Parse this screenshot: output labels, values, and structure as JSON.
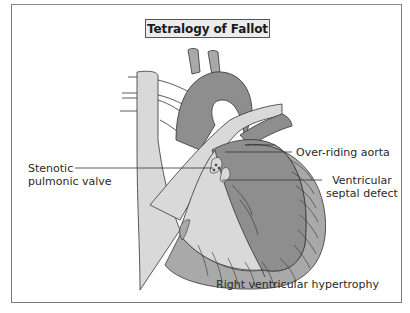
{
  "title": "Tetralogy of Fallot",
  "labels": {
    "stenotic_pulmonic_valve": {
      "line1": "Stenotic",
      "line2": "pulmonic valve"
    },
    "over_riding_aorta": "Over-riding aorta",
    "ventricular_septal_defect": {
      "line1": "Ventricular",
      "line2": "septal defect"
    },
    "right_ventricular_hypertrophy": "Right ventricular hypertrophy"
  },
  "colors": {
    "dark_chamber": "#8e8e8e",
    "medium_tissue": "#a9a9a9",
    "light_tissue": "#d9d9d9",
    "outline": "#333333",
    "frame": "#7a7a7a"
  }
}
